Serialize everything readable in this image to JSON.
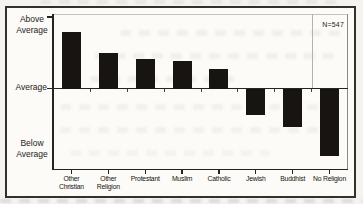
{
  "figure": {
    "n_label": "N=547",
    "y_axis": {
      "above": "Above\nAverage",
      "average": "Average",
      "below": "Below\nAverage"
    }
  },
  "chart_data": {
    "type": "bar",
    "title": "",
    "xlabel": "",
    "ylabel": "",
    "categories": [
      "Other Christian",
      "Other Religion",
      "Protestant",
      "Muslim",
      "Catholic",
      "Jewish",
      "Buddhist",
      "No Religion"
    ],
    "category_label_lines": [
      [
        "Other",
        "Christian"
      ],
      [
        "Other",
        "Religion"
      ],
      [
        "Protestant"
      ],
      [
        "Muslim"
      ],
      [
        "Catholic"
      ],
      [
        "Jewish"
      ],
      [
        "Buddhist"
      ],
      [
        "No Religion"
      ]
    ],
    "values": [
      0.79,
      0.5,
      0.42,
      0.39,
      0.28,
      -0.36,
      -0.53,
      -0.93
    ],
    "value_scale": "relative to the Average baseline; +1.0 equals the 'Above Average' axis tick, negative values extend below Average",
    "baseline_label": "Average",
    "ytick_labels": [
      "Above Average",
      "Average",
      "Below Average"
    ],
    "annotation": "N=547",
    "sample_size": 547,
    "bar_color": "#171411",
    "grid": false,
    "legend": "none"
  }
}
